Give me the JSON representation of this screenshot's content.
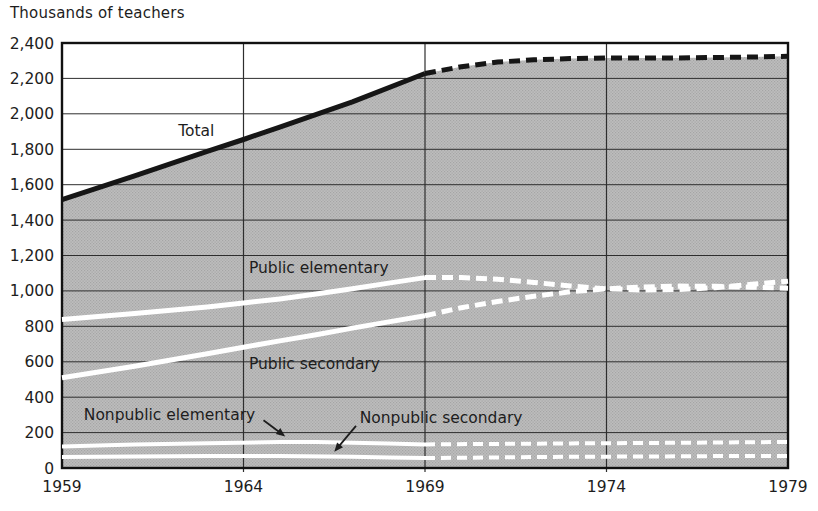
{
  "chart_data": {
    "type": "line",
    "title": "Thousands of teachers",
    "xlabel": "",
    "ylabel": "Thousands of teachers",
    "xlim": [
      1959,
      1979
    ],
    "ylim": [
      0,
      2400
    ],
    "grid": true,
    "legend_position": "none",
    "x_ticks": [
      1959,
      1964,
      1969,
      1974,
      1979
    ],
    "x_tick_labels": [
      "1959",
      "1964",
      "1969",
      "1974",
      "1979"
    ],
    "y_ticks": [
      0,
      200,
      400,
      600,
      800,
      1000,
      1200,
      1400,
      1600,
      1800,
      2000,
      2200,
      2400
    ],
    "y_tick_labels": [
      "0",
      "200",
      "400",
      "600",
      "800",
      "1,000",
      "1,200",
      "1,400",
      "1,600",
      "1,800",
      "2,000",
      "2,200",
      "2,400"
    ],
    "projection_start_year": 1969,
    "area_under_total": true,
    "series": [
      {
        "name": "Total",
        "key": "total",
        "style": {
          "color": "#161616",
          "width": 5,
          "dash": "11 6"
        },
        "actual": [
          [
            1959,
            1515
          ],
          [
            1961,
            1650
          ],
          [
            1963,
            1788
          ],
          [
            1964,
            1855
          ],
          [
            1965,
            1925
          ],
          [
            1967,
            2068
          ],
          [
            1969,
            2228
          ]
        ],
        "projected": [
          [
            1969,
            2228
          ],
          [
            1970,
            2266
          ],
          [
            1971,
            2292
          ],
          [
            1972,
            2305
          ],
          [
            1973,
            2312
          ],
          [
            1974,
            2315
          ],
          [
            1975,
            2315
          ],
          [
            1976,
            2316
          ],
          [
            1977,
            2318
          ],
          [
            1978,
            2321
          ],
          [
            1979,
            2325
          ]
        ]
      },
      {
        "name": "Public elementary",
        "key": "public-elementary",
        "style": {
          "color": "#ffffff",
          "width": 5,
          "dash": "11 6"
        },
        "actual": [
          [
            1959,
            838
          ],
          [
            1961,
            872
          ],
          [
            1963,
            910
          ],
          [
            1964,
            932
          ],
          [
            1965,
            955
          ],
          [
            1966,
            982
          ],
          [
            1967,
            1012
          ],
          [
            1968,
            1044
          ],
          [
            1969,
            1075
          ]
        ],
        "projected": [
          [
            1969,
            1075
          ],
          [
            1970,
            1076
          ],
          [
            1971,
            1066
          ],
          [
            1972,
            1048
          ],
          [
            1973,
            1028
          ],
          [
            1974,
            1012
          ],
          [
            1975,
            1005
          ],
          [
            1976,
            1008
          ],
          [
            1977,
            1018
          ],
          [
            1978,
            1038
          ],
          [
            1979,
            1055
          ]
        ]
      },
      {
        "name": "Public secondary",
        "key": "public-secondary",
        "style": {
          "color": "#ffffff",
          "width": 5,
          "dash": "11 6"
        },
        "actual": [
          [
            1959,
            510
          ],
          [
            1961,
            575
          ],
          [
            1963,
            645
          ],
          [
            1964,
            682
          ],
          [
            1965,
            718
          ],
          [
            1966,
            753
          ],
          [
            1967,
            790
          ],
          [
            1968,
            825
          ],
          [
            1969,
            860
          ]
        ],
        "projected": [
          [
            1969,
            860
          ],
          [
            1970,
            905
          ],
          [
            1971,
            940
          ],
          [
            1972,
            970
          ],
          [
            1973,
            995
          ],
          [
            1974,
            1012
          ],
          [
            1975,
            1022
          ],
          [
            1976,
            1027
          ],
          [
            1977,
            1026
          ],
          [
            1978,
            1021
          ],
          [
            1979,
            1015
          ]
        ]
      },
      {
        "name": "Nonpublic elementary",
        "key": "nonpublic-elementary",
        "style": {
          "color": "#ffffff",
          "width": 4,
          "dash": "10 6"
        },
        "actual": [
          [
            1959,
            122
          ],
          [
            1961,
            132
          ],
          [
            1963,
            140
          ],
          [
            1965,
            146
          ],
          [
            1966,
            146
          ],
          [
            1967,
            143
          ],
          [
            1968,
            138
          ],
          [
            1969,
            133
          ]
        ],
        "projected": [
          [
            1969,
            133
          ],
          [
            1971,
            136
          ],
          [
            1973,
            139
          ],
          [
            1975,
            141
          ],
          [
            1977,
            144
          ],
          [
            1979,
            147
          ]
        ]
      },
      {
        "name": "Nonpublic secondary",
        "key": "nonpublic-secondary",
        "style": {
          "color": "#ffffff",
          "width": 4,
          "dash": "10 6"
        },
        "actual": [
          [
            1959,
            62
          ],
          [
            1961,
            65
          ],
          [
            1963,
            67
          ],
          [
            1965,
            67
          ],
          [
            1967,
            64
          ],
          [
            1968,
            60
          ],
          [
            1969,
            56
          ]
        ],
        "projected": [
          [
            1969,
            56
          ],
          [
            1971,
            60
          ],
          [
            1973,
            63
          ],
          [
            1975,
            65
          ],
          [
            1977,
            67
          ],
          [
            1979,
            68
          ]
        ]
      }
    ],
    "annotations": [
      {
        "id": "total",
        "text": "Total",
        "x": 1962.2,
        "y": 1875,
        "anchor": "start"
      },
      {
        "id": "public-elementary",
        "text": "Public elementary",
        "x": 1964.15,
        "y": 1100,
        "anchor": "start"
      },
      {
        "id": "public-secondary",
        "text": "Public secondary",
        "x": 1964.15,
        "y": 560,
        "anchor": "start"
      },
      {
        "id": "nonpublic-elementary",
        "text": "Nonpublic elementary",
        "x": 1959.6,
        "y": 272,
        "anchor": "start",
        "arrow": {
          "from": [
            1964.55,
            270
          ],
          "to": [
            1965.15,
            178
          ]
        }
      },
      {
        "id": "nonpublic-secondary",
        "text": "Nonpublic secondary",
        "x": 1967.2,
        "y": 255,
        "anchor": "start",
        "arrow": {
          "from": [
            1967.1,
            238
          ],
          "to": [
            1966.5,
            92
          ]
        }
      }
    ],
    "colors": {
      "background": "#ffffff",
      "area_base": "#bdbdbd",
      "area_dot": "#a5a5a5",
      "grid": "#2e2e2e",
      "frame": "#111111",
      "total_line": "#161616",
      "series_line": "#ffffff",
      "text": "#1d1d1d"
    }
  }
}
